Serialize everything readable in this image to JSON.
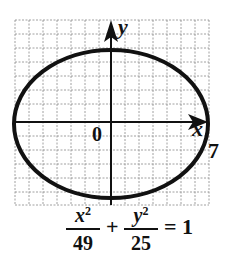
{
  "diagram": {
    "type": "ellipse-graph",
    "axes": {
      "x_label": "x",
      "y_label": "y",
      "origin_label": "0"
    },
    "vertex_label": "7",
    "equation": {
      "term1": {
        "numerator": "x",
        "exponent": "2",
        "denominator": "49"
      },
      "plus": "+",
      "term2": {
        "numerator": "y",
        "exponent": "2",
        "denominator": "25"
      },
      "equals": "= 1"
    },
    "ellipse": {
      "a": 7,
      "b": 5,
      "center": [
        0,
        0
      ]
    },
    "colors": {
      "stroke": "#111111",
      "grid": "#777777",
      "background": "#ffffff"
    }
  }
}
